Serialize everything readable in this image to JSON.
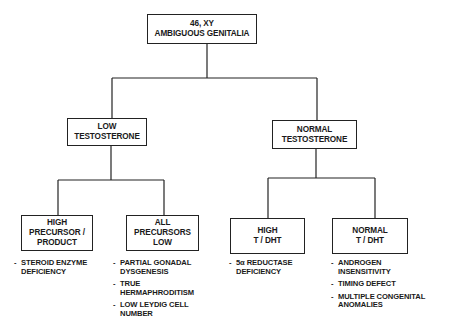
{
  "root": {
    "lines": [
      "46, XY",
      "AMBIGUOUS GENITALIA"
    ]
  },
  "level1": [
    {
      "lines": [
        "LOW",
        "TESTOSTERONE"
      ]
    },
    {
      "lines": [
        "NORMAL",
        "TESTOSTERONE"
      ]
    }
  ],
  "level2": [
    {
      "lines": [
        "HIGH",
        "PRECURSOR /",
        "PRODUCT"
      ],
      "causes": [
        {
          "lines": [
            "STEROID ENZYME",
            "DEFICIENCY"
          ]
        }
      ]
    },
    {
      "lines": [
        "ALL",
        "PRECURSORS",
        "LOW"
      ],
      "causes": [
        {
          "lines": [
            "PARTIAL GONADAL",
            "DYSGENESIS"
          ]
        },
        {
          "lines": [
            "TRUE",
            "HERMAPHRODITISM"
          ]
        },
        {
          "lines": [
            "LOW LEYDIG CELL",
            "NUMBER"
          ]
        }
      ]
    },
    {
      "lines": [
        "HIGH",
        "T / DHT"
      ],
      "causes": [
        {
          "lines": [
            "5α REDUCTASE",
            "DEFICIENCY"
          ]
        }
      ]
    },
    {
      "lines": [
        "NORMAL",
        "T / DHT"
      ],
      "causes": [
        {
          "lines": [
            "ANDROGEN",
            "INSENSITIVITY"
          ]
        },
        {
          "lines": [
            "TIMING DEFECT"
          ]
        },
        {
          "lines": [
            "MULTIPLE CONGENITAL",
            "ANOMALIES"
          ]
        }
      ]
    }
  ],
  "bullet": "-"
}
